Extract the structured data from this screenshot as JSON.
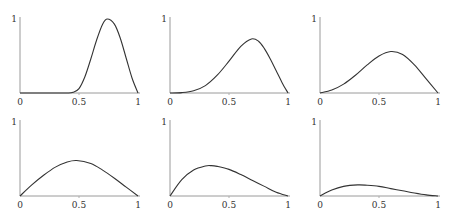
{
  "chart_data": [
    {
      "type": "line",
      "title": "",
      "xlabel": "",
      "ylabel": "",
      "x_ticks": [
        "0",
        "0.5",
        "1"
      ],
      "y_ticks": [
        "1"
      ],
      "xlim": [
        0,
        1
      ],
      "ylim": [
        0,
        1
      ],
      "grid": false,
      "x": [
        0,
        0.1,
        0.2,
        0.3,
        0.4,
        0.45,
        0.5,
        0.55,
        0.6,
        0.65,
        0.7,
        0.74,
        0.8,
        0.85,
        0.9,
        0.95,
        1.0
      ],
      "values": [
        0,
        0,
        0,
        0,
        0,
        0.01,
        0.06,
        0.22,
        0.46,
        0.72,
        0.93,
        1.0,
        0.93,
        0.74,
        0.47,
        0.2,
        0
      ]
    },
    {
      "type": "line",
      "title": "",
      "xlabel": "",
      "ylabel": "",
      "x_ticks": [
        "0",
        "0.5",
        "1"
      ],
      "y_ticks": [
        "1"
      ],
      "xlim": [
        0,
        1
      ],
      "ylim": [
        0,
        1
      ],
      "grid": false,
      "x": [
        0,
        0.1,
        0.2,
        0.3,
        0.4,
        0.5,
        0.6,
        0.69,
        0.75,
        0.8,
        0.85,
        0.9,
        0.95,
        1.0
      ],
      "values": [
        0,
        0.005,
        0.03,
        0.1,
        0.24,
        0.43,
        0.63,
        0.73,
        0.7,
        0.6,
        0.46,
        0.3,
        0.14,
        0
      ]
    },
    {
      "type": "line",
      "title": "",
      "xlabel": "",
      "ylabel": "",
      "x_ticks": [
        "0",
        "0.5",
        "1"
      ],
      "y_ticks": [
        "1"
      ],
      "xlim": [
        0,
        1
      ],
      "ylim": [
        0,
        1
      ],
      "grid": false,
      "x": [
        0,
        0.1,
        0.2,
        0.3,
        0.4,
        0.5,
        0.6,
        0.7,
        0.8,
        0.9,
        1.0
      ],
      "values": [
        0,
        0.04,
        0.12,
        0.24,
        0.38,
        0.5,
        0.56,
        0.52,
        0.38,
        0.19,
        0
      ]
    },
    {
      "type": "line",
      "title": "",
      "xlabel": "",
      "ylabel": "",
      "x_ticks": [
        "0",
        "0.5",
        "1"
      ],
      "y_ticks": [
        "1"
      ],
      "xlim": [
        0,
        1
      ],
      "ylim": [
        0,
        1
      ],
      "grid": false,
      "x": [
        0,
        0.1,
        0.2,
        0.3,
        0.4,
        0.48,
        0.6,
        0.7,
        0.8,
        0.9,
        1.0
      ],
      "values": [
        0,
        0.15,
        0.28,
        0.39,
        0.46,
        0.48,
        0.44,
        0.35,
        0.24,
        0.12,
        0
      ]
    },
    {
      "type": "line",
      "title": "",
      "xlabel": "",
      "ylabel": "",
      "x_ticks": [
        "0",
        "0.5",
        "1"
      ],
      "y_ticks": [
        "1"
      ],
      "xlim": [
        0,
        1
      ],
      "ylim": [
        0,
        1
      ],
      "grid": false,
      "x": [
        0,
        0.1,
        0.2,
        0.3,
        0.35,
        0.4,
        0.5,
        0.6,
        0.7,
        0.8,
        0.9,
        1.0
      ],
      "values": [
        0,
        0.22,
        0.35,
        0.405,
        0.41,
        0.4,
        0.36,
        0.29,
        0.21,
        0.13,
        0.05,
        0
      ]
    },
    {
      "type": "line",
      "title": "",
      "xlabel": "",
      "ylabel": "",
      "x_ticks": [
        "0",
        "0.5",
        "1"
      ],
      "y_ticks": [
        "1"
      ],
      "xlim": [
        0,
        1
      ],
      "ylim": [
        0,
        1
      ],
      "grid": false,
      "x": [
        0,
        0.1,
        0.2,
        0.32,
        0.4,
        0.5,
        0.6,
        0.7,
        0.8,
        0.9,
        1.0
      ],
      "values": [
        0,
        0.08,
        0.13,
        0.15,
        0.145,
        0.13,
        0.1,
        0.07,
        0.04,
        0.015,
        0
      ]
    }
  ],
  "panels": [
    {
      "y_top": "1",
      "x0": "0",
      "xmid": "0.5",
      "x1": "1"
    },
    {
      "y_top": "1",
      "x0": "0",
      "xmid": "0.5",
      "x1": "1"
    },
    {
      "y_top": "1",
      "x0": "0",
      "xmid": "0.5",
      "x1": "1"
    },
    {
      "y_top": "1",
      "x0": "0",
      "xmid": "0.5",
      "x1": "1"
    },
    {
      "y_top": "1",
      "x0": "0",
      "xmid": "0.5",
      "x1": "1"
    },
    {
      "y_top": "1",
      "x0": "0",
      "xmid": "0.5",
      "x1": "1"
    }
  ]
}
